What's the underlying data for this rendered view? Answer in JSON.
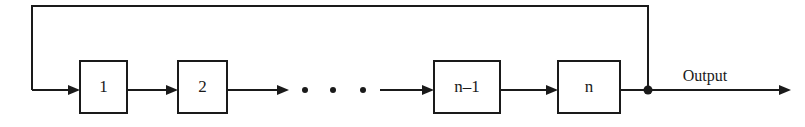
{
  "figure": {
    "kind": "block-diagram",
    "background_color": "#ffffff",
    "stroke_color": "#1a1a1a",
    "width": 805,
    "height": 127
  },
  "stages": [
    {
      "id": "stage-1",
      "label": "1",
      "x": 80,
      "y": 61,
      "w": 47,
      "h": 52
    },
    {
      "id": "stage-2",
      "label": "2",
      "x": 178,
      "y": 61,
      "w": 49,
      "h": 52
    },
    {
      "id": "stage-n-1",
      "label": "n–1",
      "x": 434,
      "y": 61,
      "w": 66,
      "h": 52
    },
    {
      "id": "stage-n",
      "label": "n",
      "x": 558,
      "y": 61,
      "w": 62,
      "h": 52
    }
  ],
  "ellipsis": {
    "label": "• • •",
    "dots": [
      {
        "cx": 305,
        "cy": 90,
        "r": 3
      },
      {
        "cx": 333,
        "cy": 90,
        "r": 3
      },
      {
        "cx": 363,
        "cy": 90,
        "r": 3
      }
    ]
  },
  "connections": [
    {
      "id": "feedback-to-stage-1",
      "from": "feedback-bus",
      "to": "stage-1",
      "x1": 32,
      "y1": 90,
      "x2": 80,
      "y2": 90,
      "arrow": true
    },
    {
      "id": "stage-1-to-stage-2",
      "from": "stage-1",
      "to": "stage-2",
      "x1": 127,
      "y1": 90,
      "x2": 178,
      "y2": 90,
      "arrow": true
    },
    {
      "id": "stage-2-to-ellipsis",
      "from": "stage-2",
      "to": "ellipsis",
      "x1": 227,
      "y1": 90,
      "x2": 289,
      "y2": 90,
      "arrow": true
    },
    {
      "id": "ellipsis-to-stage-n-1",
      "from": "ellipsis",
      "to": "stage-n-1",
      "x1": 380,
      "y1": 90,
      "x2": 434,
      "y2": 90,
      "arrow": true
    },
    {
      "id": "stage-n-1-to-stage-n",
      "from": "stage-n-1",
      "to": "stage-n",
      "x1": 500,
      "y1": 90,
      "x2": 558,
      "y2": 90,
      "arrow": true
    },
    {
      "id": "stage-n-to-junction",
      "from": "stage-n",
      "to": "output-junction",
      "x1": 620,
      "y1": 90,
      "x2": 650,
      "y2": 90,
      "arrow": false
    },
    {
      "id": "junction-to-output",
      "from": "output-junction",
      "to": "output-terminal",
      "x1": 648,
      "y1": 90,
      "x2": 791,
      "y2": 90,
      "arrow": true
    }
  ],
  "feedback_path": {
    "id": "feedback-bus",
    "label": "feedback",
    "points": "648,90 648,6 32,6 32,90",
    "tap_x": 648,
    "tap_y": 90,
    "top_y": 6,
    "return_x": 32
  },
  "junction": {
    "id": "output-junction",
    "cx": 648,
    "cy": 90,
    "r": 4.5
  },
  "output": {
    "label": "Output",
    "label_x": 705,
    "label_y": 81,
    "arrow_tip_x": 791,
    "arrow_y": 90
  },
  "arrow_head": {
    "length": 12,
    "half_height": 5
  }
}
